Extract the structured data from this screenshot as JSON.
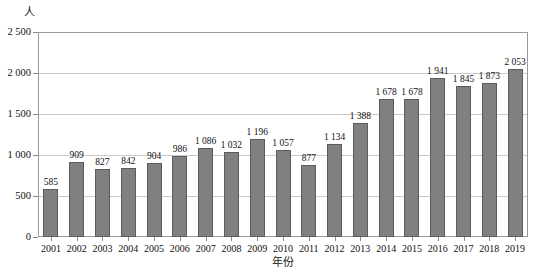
{
  "chart_data": {
    "type": "bar",
    "title": "",
    "xlabel": "年份",
    "ylabel": "人",
    "ylim": [
      0,
      2500
    ],
    "ytick_values": [
      0,
      500,
      1000,
      1500,
      2000,
      2500
    ],
    "ytick_labels": [
      "0",
      "500",
      "1 000",
      "1 500",
      "2 000",
      "2 500"
    ],
    "grid": true,
    "legend": false,
    "categories": [
      "2001",
      "2002",
      "2003",
      "2004",
      "2005",
      "2006",
      "2007",
      "2008",
      "2009",
      "2010",
      "2011",
      "2012",
      "2013",
      "2014",
      "2015",
      "2016",
      "2017",
      "2018",
      "2019"
    ],
    "values": [
      585,
      909,
      827,
      842,
      904,
      986,
      1086,
      1032,
      1196,
      1057,
      877,
      1134,
      1388,
      1678,
      1678,
      1941,
      1845,
      1873,
      2053
    ],
    "value_labels": [
      "585",
      "909",
      "827",
      "842",
      "904",
      "986",
      "1 086",
      "1 032",
      "1 196",
      "1 057",
      "877",
      "1 134",
      "1 388",
      "1 678",
      "1 678",
      "1 941",
      "1 845",
      "1 873",
      "2 053"
    ],
    "bar_color": "#808080",
    "bar_border_color": "#5c5c5c",
    "grid_color": "#c9c9c9",
    "axis_color": "#9a9a9a"
  }
}
